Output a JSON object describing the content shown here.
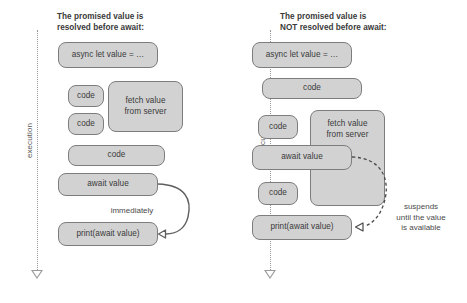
{
  "diagram": {
    "type": "flow-diagram",
    "canvas": {
      "width": 467,
      "height": 303,
      "background": "#ffffff"
    },
    "style": {
      "block_fill": "#d2d2d2",
      "block_stroke": "#7d7d7d",
      "text_color": "#3a3a3a",
      "axis_color": "#9a9a9a"
    }
  },
  "panels": [
    {
      "id": "resolved",
      "title": "The promised value is\nresolved before await:",
      "axis": {
        "label": "execution",
        "direction": "downward",
        "style": "dotted-arrow"
      },
      "blocks": [
        {
          "name": "async-let-block",
          "label": "async let value = …"
        },
        {
          "name": "code-block-1",
          "label": "code"
        },
        {
          "name": "fetch-block",
          "label": "fetch value\nfrom server"
        },
        {
          "name": "code-block-2",
          "label": "code"
        },
        {
          "name": "code-block-3",
          "label": "code"
        },
        {
          "name": "await-value-block",
          "label": "await value"
        },
        {
          "name": "print-block",
          "label": "print(await value)"
        }
      ],
      "annotations": [
        {
          "name": "immediately-note",
          "label": "immediately",
          "arrow": "solid-curved"
        }
      ]
    },
    {
      "id": "not-resolved",
      "title": "The promised value is\nNOT resolved before await:",
      "axis": {
        "label": "execution",
        "direction": "downward",
        "style": "dotted-arrow"
      },
      "blocks": [
        {
          "name": "async-let-block",
          "label": "async let value = …"
        },
        {
          "name": "code-block-1",
          "label": "code"
        },
        {
          "name": "code-block-2",
          "label": "code"
        },
        {
          "name": "fetch-block",
          "label": "fetch value\nfrom server"
        },
        {
          "name": "await-value-block",
          "label": "await value"
        },
        {
          "name": "code-block-3",
          "label": "code"
        },
        {
          "name": "print-block",
          "label": "print(await value)"
        }
      ],
      "annotations": [
        {
          "name": "suspends-note",
          "label": "suspends\nuntil the value\nis available",
          "arrow": "dashed-curved"
        }
      ]
    }
  ]
}
